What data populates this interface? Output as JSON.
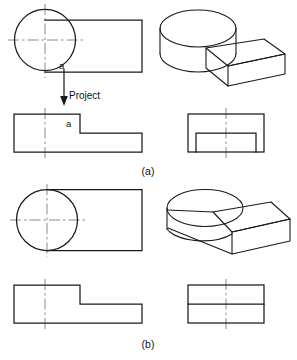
{
  "figure": {
    "type": "engineering-orthographic-drawing",
    "colors": {
      "object_line": "#1a1a1a",
      "center_line": "#8a8a8a",
      "background": "#ffffff",
      "text": "#111111"
    }
  },
  "panels": [
    {
      "id": "a",
      "caption": "(a)",
      "caption_x": 148,
      "caption_y": 175,
      "point_label": "a",
      "annotation": "Project",
      "views": {
        "top": {
          "name": "top-view-a",
          "circle": {
            "cx": 45,
            "cy": 40,
            "r": 30.5
          },
          "rect": {
            "x": 45,
            "y": 20,
            "w": 97,
            "h": 52
          },
          "center_h": {
            "x1": 8,
            "y1": 40,
            "x2": 84,
            "y2": 40
          },
          "center_v": {
            "x1": 45,
            "y1": 4,
            "x2": 45,
            "y2": 78
          },
          "label_point": {
            "x": 60,
            "y": 68
          }
        },
        "pictorial": {
          "name": "pictorial-view-a",
          "style": "cylinder with offset rectangular block, visible intersection edge"
        },
        "front": {
          "name": "front-view-a",
          "tall_block": {
            "x": 14,
            "y": 114,
            "w": 66,
            "h": 38
          },
          "low_block": {
            "x": 80,
            "y": 133,
            "w": 62,
            "h": 19
          },
          "center_v": {
            "x1": 45,
            "y1": 108,
            "x2": 45,
            "y2": 158
          },
          "label_point": {
            "x": 69,
            "y": 127
          }
        },
        "side": {
          "name": "side-view-a",
          "outer": {
            "x": 188,
            "y": 114,
            "w": 76,
            "h": 38
          },
          "inner": {
            "x": 196,
            "y": 133,
            "w": 60,
            "h": 19
          },
          "center_v": {
            "x1": 226,
            "y1": 108,
            "x2": 226,
            "y2": 158
          }
        }
      }
    },
    {
      "id": "b",
      "caption": "(b)",
      "caption_x": 148,
      "caption_y": 348,
      "views": {
        "top": {
          "name": "top-view-b",
          "circle": {
            "cx": 47,
            "cy": 220,
            "r": 30.5
          },
          "rect": {
            "x": 47,
            "y": 189.5,
            "w": 95,
            "h": 61
          },
          "center_h": {
            "x1": 10,
            "y1": 220,
            "x2": 86,
            "y2": 220
          },
          "center_v": {
            "x1": 47,
            "y1": 184,
            "x2": 47,
            "y2": 257
          }
        },
        "pictorial": {
          "name": "pictorial-view-b",
          "style": "cylinder tangent-blended into rectangular block, no intersection edge"
        },
        "front": {
          "name": "front-view-b",
          "tall_block": {
            "x": 14,
            "y": 285,
            "w": 66,
            "h": 38
          },
          "low_block": {
            "x": 80,
            "y": 304,
            "w": 62,
            "h": 19
          },
          "center_v": {
            "x1": 45,
            "y1": 279,
            "x2": 45,
            "y2": 329
          }
        },
        "side": {
          "name": "side-view-b",
          "outer": {
            "x": 188,
            "y": 285,
            "w": 76,
            "h": 38
          },
          "divider": {
            "x1": 188,
            "y1": 304,
            "x2": 264,
            "y2": 304
          },
          "center_v": {
            "x1": 226,
            "y1": 279,
            "x2": 226,
            "y2": 329
          }
        }
      }
    }
  ]
}
